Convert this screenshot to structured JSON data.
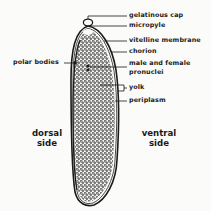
{
  "diagram": {
    "labels": {
      "gelatinous_cap": "gelatinous cap",
      "micropyle": "micropyle",
      "vitelline_membrane": "vitelline membrane",
      "chorion": "chorion",
      "pronuclei_line1": "male and female",
      "pronuclei_line2": "pronuclei",
      "yolk": "yolk",
      "periplasm": "periplasm",
      "polar_bodies": "polar bodies"
    },
    "sides": {
      "dorsal_line1": "dorsal",
      "dorsal_line2": "side",
      "ventral_line1": "ventral",
      "ventral_line2": "side"
    },
    "colors": {
      "ink": "#1a1a1a",
      "paper": "#fbfbf9"
    }
  }
}
